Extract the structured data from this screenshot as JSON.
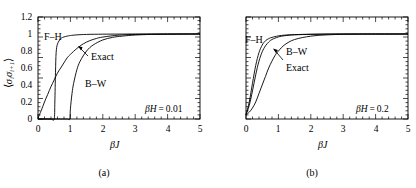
{
  "figure": {
    "panels": [
      {
        "id": "a",
        "caption": "(a)",
        "param_label": "βH = 0.01",
        "xlabel": "βJ",
        "ylabel_parts": {
          "open": "⟨",
          "s1": "σ",
          "s1sub": "i",
          "s2": "σ",
          "s2sub": "i+1",
          "close": "⟩"
        },
        "show_ytick_labels": true,
        "xticks": [
          "0",
          "1",
          "2",
          "3",
          "4",
          "5"
        ],
        "yticks": [
          "0",
          "0.2",
          "0.4",
          "0.6",
          "0.8",
          "1",
          "1.2"
        ],
        "curve_labels": [
          {
            "name": "F–H",
            "text": "F–H"
          },
          {
            "name": "B–W",
            "text": "B–W"
          },
          {
            "name": "Exact",
            "text": "Exact"
          }
        ]
      },
      {
        "id": "b",
        "caption": "(b)",
        "param_label": "βH = 0.2",
        "xlabel": "βJ",
        "ylabel_parts": null,
        "show_ytick_labels": false,
        "xticks": [
          "0",
          "1",
          "2",
          "3",
          "4",
          "5"
        ],
        "yticks": [],
        "curve_labels": [
          {
            "name": "F–H",
            "text": "F–H"
          },
          {
            "name": "B–W",
            "text": "B–W"
          },
          {
            "name": "Exact",
            "text": "Exact"
          }
        ]
      }
    ]
  },
  "chart_data": [
    {
      "type": "line",
      "title": "",
      "panel": "(a)",
      "annotation": "βH = 0.01",
      "xlabel": "βJ",
      "ylabel": "⟨σiσi+1⟩",
      "xlim": [
        0,
        5
      ],
      "ylim": [
        0,
        1.2
      ],
      "xticks": [
        0,
        1,
        2,
        3,
        4,
        5
      ],
      "yticks": [
        0,
        0.2,
        0.4,
        0.6,
        0.8,
        1,
        1.2
      ],
      "grid": false,
      "legend": "inline-annotations",
      "series": [
        {
          "name": "Exact",
          "x": [
            0,
            0.1,
            0.2,
            0.3,
            0.4,
            0.5,
            0.6,
            0.7,
            0.8,
            0.9,
            1.0,
            1.2,
            1.4,
            1.6,
            1.8,
            2.0,
            2.5,
            3.0,
            3.5,
            4.0,
            4.5,
            5.0
          ],
          "y": [
            0.01,
            0.1,
            0.2,
            0.29,
            0.38,
            0.46,
            0.54,
            0.6,
            0.66,
            0.72,
            0.76,
            0.83,
            0.885,
            0.922,
            0.947,
            0.964,
            0.987,
            0.995,
            0.998,
            0.999,
            1.0,
            1.0
          ]
        },
        {
          "name": "F–H",
          "x": [
            0,
            0.2,
            0.4,
            0.5,
            0.52,
            0.54,
            0.56,
            0.6,
            0.7,
            0.8,
            0.9,
            1.0,
            1.2,
            1.5,
            2.0,
            2.5,
            3.0,
            4.0,
            5.0
          ],
          "y": [
            0,
            0,
            0,
            0,
            0.2,
            0.55,
            0.78,
            0.88,
            0.945,
            0.965,
            0.975,
            0.982,
            0.99,
            0.995,
            0.998,
            0.999,
            1.0,
            1.0,
            1.0
          ]
        },
        {
          "name": "B–W",
          "x": [
            0,
            0.3,
            0.6,
            0.9,
            0.98,
            1.0,
            1.05,
            1.1,
            1.2,
            1.3,
            1.5,
            1.7,
            2.0,
            2.3,
            2.6,
            3.0,
            3.5,
            4.0,
            4.5,
            5.0
          ],
          "y": [
            0,
            0,
            0,
            0,
            0,
            0.12,
            0.3,
            0.42,
            0.58,
            0.68,
            0.8,
            0.87,
            0.93,
            0.96,
            0.975,
            0.988,
            0.995,
            0.998,
            0.999,
            1.0
          ]
        }
      ]
    },
    {
      "type": "line",
      "title": "",
      "panel": "(b)",
      "annotation": "βH = 0.2",
      "xlabel": "βJ",
      "ylabel": "",
      "xlim": [
        0,
        5
      ],
      "ylim": [
        0,
        1.2
      ],
      "xticks": [
        0,
        1,
        2,
        3,
        4,
        5
      ],
      "yticks": [
        0,
        0.2,
        0.4,
        0.6,
        0.8,
        1,
        1.2
      ],
      "grid": false,
      "legend": "inline-annotations",
      "series": [
        {
          "name": "F–H",
          "x": [
            0,
            0.1,
            0.2,
            0.3,
            0.4,
            0.5,
            0.6,
            0.7,
            0.8,
            1.0,
            1.2,
            1.5,
            2.0,
            2.5,
            3.0,
            4.0,
            5.0
          ],
          "y": [
            0.05,
            0.2,
            0.42,
            0.63,
            0.78,
            0.87,
            0.92,
            0.945,
            0.96,
            0.978,
            0.987,
            0.993,
            0.997,
            0.999,
            1.0,
            1.0,
            1.0
          ]
        },
        {
          "name": "Exact",
          "x": [
            0,
            0.1,
            0.2,
            0.3,
            0.4,
            0.5,
            0.6,
            0.7,
            0.8,
            1.0,
            1.2,
            1.5,
            2.0,
            2.5,
            3.0,
            4.0,
            5.0
          ],
          "y": [
            0.05,
            0.16,
            0.33,
            0.52,
            0.68,
            0.79,
            0.86,
            0.905,
            0.935,
            0.965,
            0.98,
            0.99,
            0.996,
            0.999,
            1.0,
            1.0,
            1.0
          ]
        },
        {
          "name": "B–W",
          "x": [
            0,
            0.1,
            0.2,
            0.3,
            0.4,
            0.5,
            0.6,
            0.7,
            0.8,
            0.9,
            1.0,
            1.2,
            1.5,
            2.0,
            2.5,
            3.0,
            3.5,
            4.0,
            5.0
          ],
          "y": [
            0.05,
            0.08,
            0.13,
            0.2,
            0.3,
            0.4,
            0.5,
            0.6,
            0.68,
            0.75,
            0.8,
            0.875,
            0.935,
            0.975,
            0.99,
            0.996,
            0.998,
            0.999,
            1.0
          ]
        }
      ]
    }
  ]
}
